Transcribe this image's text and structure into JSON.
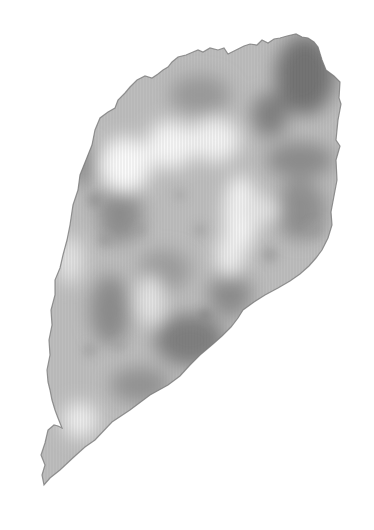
{
  "image": {
    "description": "Grayscale photograph of an irregular leaf-like fragment on a white background",
    "background_color": "#ffffff",
    "subject": {
      "name": "leaf-fragment",
      "base_tone": "#b8b8b8",
      "dark_tone": "#6e6e6e",
      "light_tone": "#f6f6f6",
      "edge_tone": "#7a7a7a"
    }
  }
}
